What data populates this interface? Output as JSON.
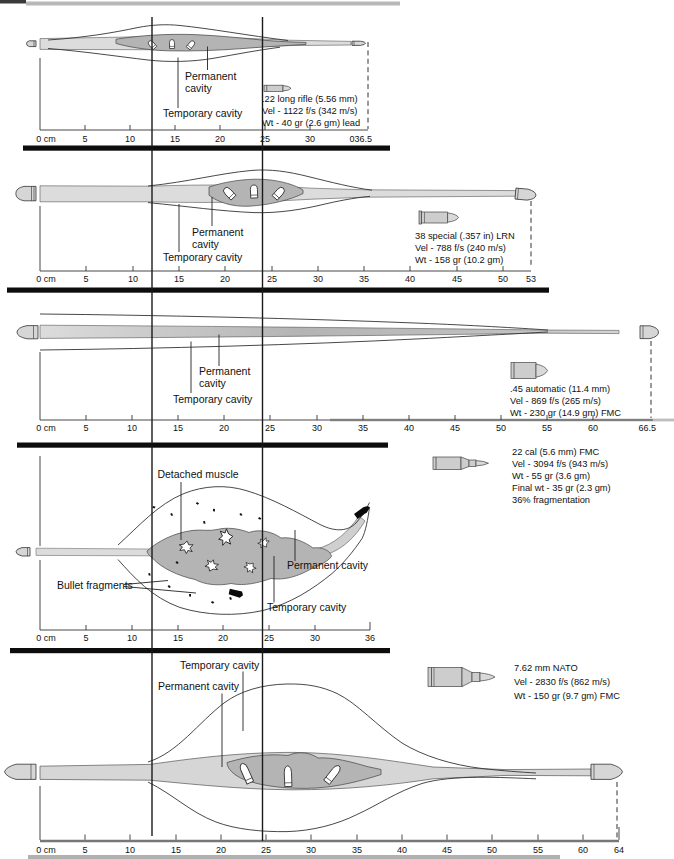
{
  "figure": {
    "type": "wound-ballistics-profiles",
    "unit": "cm",
    "colors": {
      "permanent_cavity": "#b4b4b4",
      "track": "#dcdcdc",
      "separator_bar": "#0d0d0d",
      "background": "#ffffff"
    }
  },
  "panels": [
    {
      "name": ".22 long rifle",
      "caption": [
        ".22 long rifle (5.56 mm)",
        "Vel - 1122 f/s (342 m/s)",
        "Wt - 40 gr (2.6 gm) lead"
      ],
      "labels": {
        "permanent_line1": "Permanent",
        "permanent_line2": "cavity",
        "temporary": "Temporary cavity"
      },
      "ticks": [
        "0 cm",
        "5",
        "10",
        "15",
        "20",
        "25",
        "30",
        "036.5"
      ]
    },
    {
      "name": "38 special",
      "caption": [
        "38 special (.357 in) LRN",
        "Vel - 788 f/s (240 m/s)",
        "Wt - 158 gr (10.2 gm)"
      ],
      "labels": {
        "permanent_line1": "Permanent",
        "permanent_line2": "cavity",
        "temporary": "Temporary cavity"
      },
      "ticks": [
        "0 cm",
        "5",
        "10",
        "15",
        "20",
        "25",
        "30",
        "35",
        "40",
        "45",
        "50",
        "53"
      ]
    },
    {
      "name": ".45 automatic",
      "caption": [
        ".45 automatic (11.4 mm)",
        "Vel - 869 f/s (265 m/s)",
        "Wt - 230 gr (14.9 gm) FMC"
      ],
      "labels": {
        "permanent_line1": "Permanent",
        "permanent_line2": "cavity",
        "temporary": "Temporary cavity"
      },
      "ticks": [
        "0 cm",
        "5",
        "10",
        "15",
        "20",
        "25",
        "30",
        "35",
        "40",
        "45",
        "50",
        "55",
        "60",
        "66.5"
      ]
    },
    {
      "name": "22 cal FMC",
      "caption": [
        "22 cal (5.6 mm) FMC",
        "Vel - 3094 f/s (943 m/s)",
        "Wt - 55 gr (3.6 gm)",
        "Final wt - 35 gr (2.3 gm)",
        "36% fragmentation"
      ],
      "labels": {
        "detached_muscle": "Detached muscle",
        "bullet_fragments": "Bullet fragments",
        "permanent": "Permanent cavity",
        "temporary": "Temporary cavity"
      },
      "ticks": [
        "0 cm",
        "5",
        "10",
        "15",
        "20",
        "25",
        "30",
        "36"
      ]
    },
    {
      "name": "7.62 mm NATO",
      "caption": [
        "7.62 mm NATO",
        "Vel - 2830 f/s (862 m/s)",
        "Wt - 150 gr (9.7 gm) FMC"
      ],
      "labels": {
        "temporary": "Temporary cavity",
        "permanent": "Permanent cavity"
      },
      "ticks": [
        "0 cm",
        "5",
        "10",
        "15",
        "20",
        "25",
        "30",
        "35",
        "40",
        "45",
        "50",
        "55",
        "60",
        "64"
      ]
    }
  ]
}
